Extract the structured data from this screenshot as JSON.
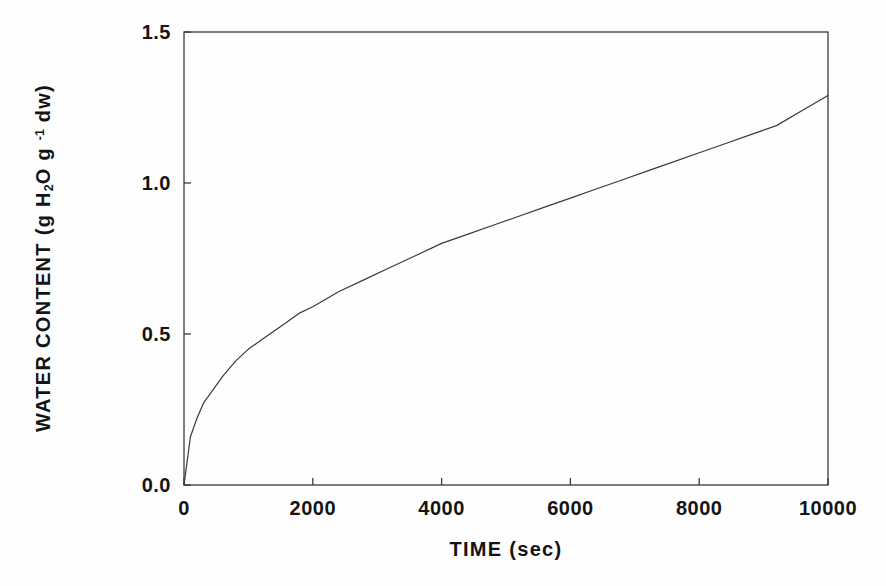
{
  "figure": {
    "background_color": "#fefefe",
    "ink_color": "#141414",
    "frame_color": "#3a3a3a"
  },
  "axes": {
    "x_title": "TIME  (sec)",
    "y_title_prefix": "WATER CONTENT  (g H",
    "y_title_sub": "2",
    "y_title_mid": "O  g ",
    "y_title_sup": "-1",
    "y_title_suffix": " dw)",
    "x_tick_labels": [
      "0",
      "2000",
      "4000",
      "6000",
      "8000",
      "10000"
    ],
    "y_tick_labels": [
      "0.0",
      "0.5",
      "1.0",
      "1.5"
    ]
  },
  "chart_data": {
    "type": "line",
    "title": "",
    "subtitle": "",
    "xlabel": "TIME (sec)",
    "ylabel": "WATER CONTENT (g H2O g -1 dw)",
    "xlim": [
      0,
      10000
    ],
    "ylim": [
      0.0,
      1.5
    ],
    "xticks": [
      0,
      2000,
      4000,
      6000,
      8000,
      10000
    ],
    "yticks": [
      0.0,
      0.5,
      1.0,
      1.5
    ],
    "grid": false,
    "legend": null,
    "legend_position": "none",
    "annotations": [],
    "series": [
      {
        "name": "water uptake",
        "color": "#3a3a3a",
        "line_width": 1.2,
        "marker": "none",
        "x": [
          0,
          100,
          200,
          300,
          400,
          500,
          600,
          800,
          1000,
          1200,
          1400,
          1600,
          1800,
          2000,
          2400,
          2800,
          3200,
          3600,
          4000,
          4400,
          4800,
          5200,
          5600,
          6000,
          6400,
          6800,
          7200,
          7600,
          8000,
          8400,
          8800,
          9200,
          9600,
          10000
        ],
        "y": [
          0.0,
          0.16,
          0.22,
          0.27,
          0.3,
          0.33,
          0.36,
          0.41,
          0.45,
          0.48,
          0.51,
          0.54,
          0.57,
          0.59,
          0.64,
          0.68,
          0.72,
          0.76,
          0.8,
          0.83,
          0.86,
          0.89,
          0.92,
          0.95,
          0.98,
          1.01,
          1.04,
          1.07,
          1.1,
          1.13,
          1.16,
          1.19,
          1.24,
          1.29
        ]
      }
    ]
  },
  "plot_geometry": {
    "left": 184,
    "right": 828,
    "top": 32,
    "bottom": 485
  }
}
